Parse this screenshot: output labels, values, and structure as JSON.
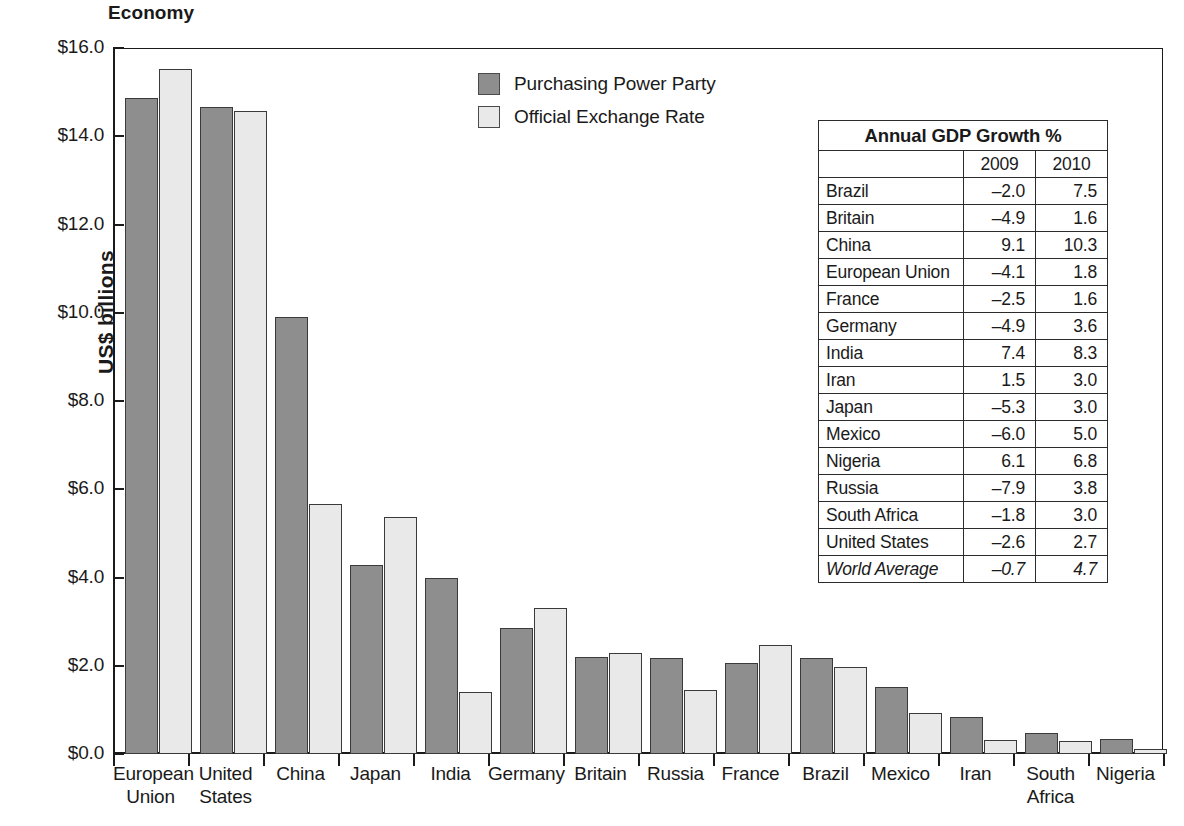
{
  "chart_data": {
    "type": "bar",
    "title": "Economy",
    "xlabel": "",
    "ylabel": "US$ billions",
    "ylim": [
      0,
      16
    ],
    "ytick_labels": [
      "$0.0",
      "$2.0",
      "$4.0",
      "$6.0",
      "$8.0",
      "$10.0",
      "$12.0",
      "$14.0",
      "$16.0"
    ],
    "ytick_values": [
      0,
      2,
      4,
      6,
      8,
      10,
      12,
      14,
      16
    ],
    "grid": false,
    "legend_position": "top-center",
    "categories": [
      "European Union",
      "United States",
      "China",
      "Japan",
      "India",
      "Germany",
      "Britain",
      "Russia",
      "France",
      "Brazil",
      "Mexico",
      "Iran",
      "South Africa",
      "Nigeria"
    ],
    "series": [
      {
        "name": "Purchasing Power Party",
        "color": "#8e8e8e",
        "values": [
          14.87,
          14.66,
          9.91,
          4.29,
          3.99,
          2.85,
          2.19,
          2.18,
          2.06,
          2.17,
          1.52,
          0.85,
          0.47,
          0.35
        ]
      },
      {
        "name": "Official Exchange Rate",
        "color": "#e9e9e9",
        "values": [
          15.52,
          14.58,
          5.67,
          5.38,
          1.4,
          3.3,
          2.28,
          1.46,
          2.48,
          1.97,
          0.94,
          0.31,
          0.3,
          0.11
        ]
      }
    ]
  },
  "legend": {
    "items": [
      {
        "label": "Purchasing Power Party",
        "swatch": "ppp"
      },
      {
        "label": "Official Exchange Rate",
        "swatch": "oer"
      }
    ]
  },
  "table": {
    "title": "Annual GDP Growth %",
    "columns": [
      "",
      "2009",
      "2010"
    ],
    "rows": [
      {
        "country": "Brazil",
        "y2009": "–2.0",
        "y2010": "7.5",
        "italic": false
      },
      {
        "country": "Britain",
        "y2009": "–4.9",
        "y2010": "1.6",
        "italic": false
      },
      {
        "country": "China",
        "y2009": "9.1",
        "y2010": "10.3",
        "italic": false
      },
      {
        "country": "European Union",
        "y2009": "–4.1",
        "y2010": "1.8",
        "italic": false
      },
      {
        "country": "France",
        "y2009": "–2.5",
        "y2010": "1.6",
        "italic": false
      },
      {
        "country": "Germany",
        "y2009": "–4.9",
        "y2010": "3.6",
        "italic": false
      },
      {
        "country": "India",
        "y2009": "7.4",
        "y2010": "8.3",
        "italic": false
      },
      {
        "country": "Iran",
        "y2009": "1.5",
        "y2010": "3.0",
        "italic": false
      },
      {
        "country": "Japan",
        "y2009": "–5.3",
        "y2010": "3.0",
        "italic": false
      },
      {
        "country": "Mexico",
        "y2009": "–6.0",
        "y2010": "5.0",
        "italic": false
      },
      {
        "country": "Nigeria",
        "y2009": "6.1",
        "y2010": "6.8",
        "italic": false
      },
      {
        "country": "Russia",
        "y2009": "–7.9",
        "y2010": "3.8",
        "italic": false
      },
      {
        "country": "South Africa",
        "y2009": "–1.8",
        "y2010": "3.0",
        "italic": false
      },
      {
        "country": "United States",
        "y2009": "–2.6",
        "y2010": "2.7",
        "italic": false
      },
      {
        "country": "World Average",
        "y2009": "–0.7",
        "y2010": "4.7",
        "italic": true
      }
    ]
  },
  "colors": {
    "ppp_bar": "#8e8e8e",
    "oer_bar": "#e9e9e9",
    "axis": "#1a1a1a",
    "table_border": "#2b2b2b",
    "background": "#ffffff"
  }
}
